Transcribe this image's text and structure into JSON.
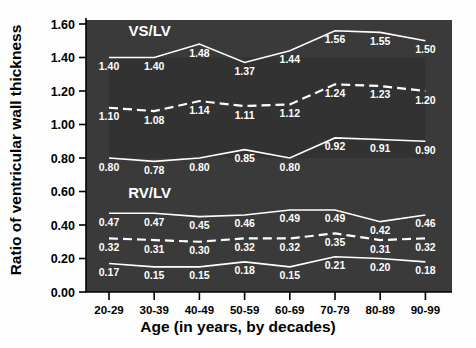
{
  "chart_data": {
    "type": "line",
    "title": "",
    "xlabel": "Age (in years, by decades)",
    "ylabel": "Ratio of ventricular wall thickness",
    "categories": [
      "20-29",
      "30-39",
      "40-49",
      "50-59",
      "60-69",
      "70-79",
      "80-89",
      "90-99"
    ],
    "ylim": [
      0.0,
      1.6
    ],
    "yticks": [
      "0.00",
      "0.20",
      "0.40",
      "0.60",
      "0.80",
      "1.00",
      "1.20",
      "1.40",
      "1.60"
    ],
    "ytick_values": [
      0.0,
      0.2,
      0.4,
      0.6,
      0.8,
      1.0,
      1.2,
      1.4,
      1.6
    ],
    "grid": false,
    "legend": "none",
    "plot_background": "#3a3a3a",
    "line_color": "#ffffff",
    "annotations": [
      {
        "text": "VS/LV",
        "x_index": 0.9,
        "y": 1.53
      },
      {
        "text": "RV/LV",
        "x_index": 0.9,
        "y": 0.56
      }
    ],
    "groups": [
      {
        "name": "VS/LV",
        "label": "VS/LV",
        "series": [
          {
            "name": "VS/LV upper",
            "style": "solid",
            "values": [
              1.4,
              1.4,
              1.48,
              1.37,
              1.44,
              1.56,
              1.55,
              1.5
            ],
            "labels": [
              "1.40",
              "1.40",
              "1.48",
              "1.37",
              "1.44",
              "1.56",
              "1.55",
              "1.50"
            ]
          },
          {
            "name": "VS/LV mean",
            "style": "dashed",
            "values": [
              1.1,
              1.08,
              1.14,
              1.11,
              1.12,
              1.24,
              1.23,
              1.2
            ],
            "labels": [
              "1.10",
              "1.08",
              "1.14",
              "1.11",
              "1.12",
              "1.24",
              "1.23",
              "1.20"
            ]
          },
          {
            "name": "VS/LV lower",
            "style": "solid",
            "values": [
              0.8,
              0.78,
              0.8,
              0.85,
              0.8,
              0.92,
              0.91,
              0.9
            ],
            "labels": [
              "0.80",
              "0.78",
              "0.80",
              "0.85",
              "0.80",
              "0.92",
              "0.91",
              "0.90"
            ]
          }
        ]
      },
      {
        "name": "RV/LV",
        "label": "RV/LV",
        "series": [
          {
            "name": "RV/LV upper",
            "style": "solid",
            "values": [
              0.47,
              0.47,
              0.45,
              0.46,
              0.49,
              0.49,
              0.42,
              0.46
            ],
            "labels": [
              "0.47",
              "0.47",
              "0.45",
              "0.46",
              "0.49",
              "0.49",
              "0.42",
              "0.46"
            ]
          },
          {
            "name": "RV/LV mean",
            "style": "dashed",
            "values": [
              0.32,
              0.31,
              0.3,
              0.32,
              0.32,
              0.35,
              0.31,
              0.32
            ],
            "labels": [
              "0.32",
              "0.31",
              "0.30",
              "0.32",
              "0.32",
              "0.35",
              "0.31",
              "0.32"
            ]
          },
          {
            "name": "RV/LV lower",
            "style": "solid",
            "values": [
              0.17,
              0.15,
              0.15,
              0.18,
              0.15,
              0.21,
              0.2,
              0.18
            ],
            "labels": [
              "0.17",
              "0.15",
              "0.15",
              "0.18",
              "0.15",
              "0.21",
              "0.20",
              "0.18"
            ]
          }
        ]
      }
    ]
  }
}
